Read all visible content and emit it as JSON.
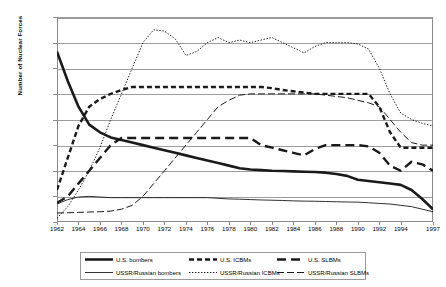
{
  "chart_data": {
    "type": "line",
    "title": "",
    "xlabel": "",
    "ylabel": "Number of Nuclear Forces",
    "ylim": [
      0,
      1600
    ],
    "yticks": [
      "0",
      "200",
      "400",
      "600",
      "800",
      "1,000",
      "1,200",
      "1,400",
      "1,600"
    ],
    "xticks": [
      "1962",
      "1964",
      "1966",
      "1968",
      "1970",
      "1972",
      "1974",
      "1976",
      "1978",
      "1980",
      "1982",
      "1984",
      "1986",
      "1988",
      "1990",
      "1992",
      "1994",
      "1997"
    ],
    "x": [
      1962,
      1963,
      1964,
      1965,
      1966,
      1967,
      1968,
      1969,
      1970,
      1971,
      1972,
      1973,
      1974,
      1975,
      1976,
      1977,
      1978,
      1979,
      1980,
      1981,
      1982,
      1983,
      1984,
      1985,
      1986,
      1987,
      1988,
      1989,
      1990,
      1991,
      1992,
      1993,
      1994,
      1995,
      1996,
      1997
    ],
    "grid": true,
    "legend_position": "bottom",
    "series": [
      {
        "name": "U.S. bombers",
        "style": "thick-solid",
        "values": [
          1330,
          1100,
          900,
          760,
          700,
          660,
          640,
          620,
          600,
          580,
          560,
          540,
          520,
          500,
          480,
          460,
          440,
          420,
          410,
          405,
          400,
          398,
          395,
          392,
          390,
          385,
          375,
          360,
          330,
          320,
          310,
          300,
          290,
          250,
          180,
          100
        ]
      },
      {
        "name": "U.S. ICBMs",
        "style": "dashed-thick",
        "values": [
          250,
          500,
          750,
          900,
          960,
          1000,
          1030,
          1054,
          1054,
          1054,
          1054,
          1054,
          1054,
          1054,
          1054,
          1054,
          1054,
          1054,
          1054,
          1054,
          1045,
          1030,
          1020,
          1010,
          1000,
          1000,
          1000,
          1000,
          1000,
          1000,
          900,
          700,
          580,
          580,
          580,
          580
        ]
      },
      {
        "name": "U.S. SLBMs",
        "style": "long-dash-thick",
        "values": [
          150,
          200,
          300,
          400,
          500,
          600,
          656,
          656,
          656,
          656,
          656,
          656,
          656,
          656,
          656,
          656,
          656,
          656,
          656,
          600,
          580,
          560,
          540,
          520,
          570,
          600,
          600,
          600,
          600,
          590,
          540,
          440,
          400,
          470,
          450,
          400
        ]
      },
      {
        "name": "USSR/Russian bombers",
        "style": "thin-solid",
        "values": [
          140,
          175,
          195,
          200,
          195,
          190,
          190,
          190,
          190,
          190,
          190,
          190,
          190,
          190,
          190,
          185,
          180,
          178,
          175,
          172,
          170,
          168,
          165,
          163,
          162,
          160,
          158,
          156,
          155,
          150,
          145,
          140,
          130,
          120,
          100,
          80
        ]
      },
      {
        "name": "USSR/Russian ICBMs",
        "style": "dotted",
        "values": [
          30,
          120,
          250,
          400,
          580,
          800,
          1000,
          1200,
          1400,
          1500,
          1490,
          1430,
          1300,
          1330,
          1400,
          1440,
          1400,
          1420,
          1400,
          1420,
          1440,
          1400,
          1360,
          1320,
          1370,
          1400,
          1400,
          1400,
          1390,
          1350,
          1200,
          1000,
          850,
          800,
          770,
          750
        ]
      },
      {
        "name": "USSR/Russian SLBMs",
        "style": "dash-dot-thin",
        "values": [
          70,
          72,
          75,
          78,
          80,
          85,
          100,
          130,
          200,
          300,
          400,
          500,
          600,
          700,
          800,
          900,
          950,
          990,
          1000,
          1000,
          1000,
          1000,
          1000,
          1000,
          1000,
          990,
          980,
          970,
          950,
          930,
          900,
          800,
          700,
          620,
          600,
          600
        ]
      }
    ]
  },
  "legend": {
    "items": [
      {
        "label": "U.S. bombers",
        "style": "thick-solid"
      },
      {
        "label": "U.S. ICBMs",
        "style": "dashed-thick"
      },
      {
        "label": "U.S. SLBMs",
        "style": "long-dash-thick"
      },
      {
        "label": "USSR/Russian bombers",
        "style": "thin-solid"
      },
      {
        "label": "USSR/Russian ICBMs",
        "style": "dotted"
      },
      {
        "label": "USSR/Russian SLBMs",
        "style": "dash-dot-thin"
      }
    ]
  },
  "colors": {
    "series": "#1a1a1a",
    "grid": "#9d9d9d",
    "axis": "#8a8a8a",
    "background": "#ffffff"
  }
}
